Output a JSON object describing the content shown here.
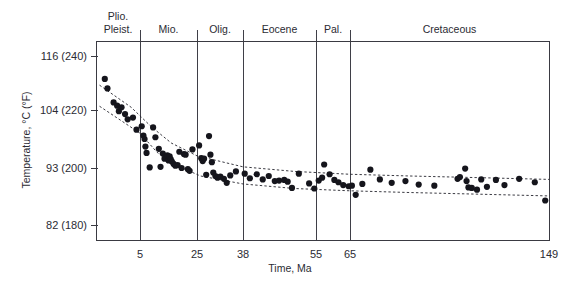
{
  "chart_data": {
    "type": "scatter",
    "title": "",
    "xlabel": "Time, Ma",
    "ylabel": "Temperature, °C (°F)",
    "xlim": [
      0,
      149
    ],
    "ylim": [
      180,
      240
    ],
    "x_unit": "Ma",
    "y_unit_primary": "°C",
    "y_unit_secondary": "°F",
    "grid": false,
    "legend": "none",
    "x_ticks": [
      {
        "value": 5,
        "label": "5"
      },
      {
        "value": 25,
        "label": "25"
      },
      {
        "value": 38,
        "label": "38"
      },
      {
        "value": 55,
        "label": "55"
      },
      {
        "value": 65,
        "label": "65"
      },
      {
        "value": 149,
        "label": "149"
      }
    ],
    "y_ticks": [
      {
        "value": 240,
        "label": "116 (240)",
        "celsius": 116,
        "fahrenheit": 240
      },
      {
        "value": 220,
        "label": "104 (220)",
        "celsius": 104,
        "fahrenheit": 220
      },
      {
        "value": 200,
        "label": "93 (200)",
        "celsius": 93,
        "fahrenheit": 200
      },
      {
        "value": 180,
        "label": "82 (180)",
        "celsius": 82,
        "fahrenheit": 180
      }
    ],
    "epochs": [
      {
        "name": "Plio.\nPleist.",
        "line1": "Plio.",
        "line2": "Pleist.",
        "start": 0,
        "end": 5
      },
      {
        "name": "Mio.",
        "line1": "Mio.",
        "line2": "",
        "start": 5,
        "end": 25
      },
      {
        "name": "Olig.",
        "line1": "Olig.",
        "line2": "",
        "start": 25,
        "end": 38
      },
      {
        "name": "Eocene",
        "line1": "Eocene",
        "line2": "",
        "start": 38,
        "end": 55
      },
      {
        "name": "Pal.",
        "line1": "Pal.",
        "line2": "",
        "start": 55,
        "end": 65
      },
      {
        "name": "Cretaceous",
        "line1": "Cretaceous",
        "line2": "",
        "start": 65,
        "end": 149
      }
    ],
    "epoch_boundaries": [
      5,
      25,
      38,
      55,
      65
    ],
    "series": [
      {
        "name": "Measured bottom-hole temperature",
        "marker": "filled-circle",
        "color": "#15151c",
        "points": [
          [
            1.0,
            231.5
          ],
          [
            1.3,
            228.0
          ],
          [
            2.0,
            222.8
          ],
          [
            2.4,
            221.6
          ],
          [
            2.6,
            219.6
          ],
          [
            2.9,
            221.0
          ],
          [
            3.3,
            218.6
          ],
          [
            3.6,
            216.8
          ],
          [
            4.2,
            217.4
          ],
          [
            4.6,
            213.2
          ],
          [
            5.6,
            214.4
          ],
          [
            6.2,
            211.2
          ],
          [
            6.6,
            210.0
          ],
          [
            6.9,
            207.4
          ],
          [
            7.3,
            205.2
          ],
          [
            8.4,
            200.2
          ],
          [
            9.6,
            214.0
          ],
          [
            10.4,
            210.6
          ],
          [
            11.6,
            206.6
          ],
          [
            12.2,
            200.4
          ],
          [
            13.0,
            205.0
          ],
          [
            13.6,
            203.2
          ],
          [
            14.1,
            203.8
          ],
          [
            14.6,
            204.4
          ],
          [
            15.0,
            202.6
          ],
          [
            15.4,
            204.0
          ],
          [
            15.8,
            203.0
          ],
          [
            16.2,
            202.2
          ],
          [
            16.8,
            201.4
          ],
          [
            17.4,
            200.8
          ],
          [
            18.2,
            201.0
          ],
          [
            18.8,
            205.6
          ],
          [
            19.6,
            200.0
          ],
          [
            20.4,
            204.8
          ],
          [
            21.0,
            204.6
          ],
          [
            21.8,
            199.6
          ],
          [
            22.4,
            199.0
          ],
          [
            23.4,
            206.4
          ],
          [
            25.6,
            207.8
          ],
          [
            26.2,
            203.4
          ],
          [
            26.6,
            202.4
          ],
          [
            27.0,
            203.2
          ],
          [
            27.6,
            197.6
          ],
          [
            28.4,
            211.0
          ],
          [
            28.8,
            204.6
          ],
          [
            29.2,
            202.0
          ],
          [
            29.6,
            198.4
          ],
          [
            30.2,
            197.2
          ],
          [
            30.8,
            196.6
          ],
          [
            31.6,
            197.0
          ],
          [
            32.6,
            196.2
          ],
          [
            33.4,
            194.8
          ],
          [
            34.4,
            197.4
          ],
          [
            36.0,
            198.8
          ],
          [
            38.4,
            198.0
          ],
          [
            39.6,
            196.4
          ],
          [
            41.2,
            197.8
          ],
          [
            42.6,
            196.0
          ],
          [
            44.0,
            197.2
          ],
          [
            45.4,
            195.4
          ],
          [
            46.4,
            195.6
          ],
          [
            47.6,
            195.8
          ],
          [
            48.4,
            195.2
          ],
          [
            49.4,
            193.0
          ],
          [
            51.0,
            198.0
          ],
          [
            53.4,
            194.6
          ],
          [
            54.6,
            192.8
          ],
          [
            55.8,
            195.6
          ],
          [
            56.8,
            196.6
          ],
          [
            57.4,
            201.2
          ],
          [
            59.0,
            197.8
          ],
          [
            60.4,
            195.8
          ],
          [
            61.6,
            195.0
          ],
          [
            63.0,
            194.0
          ],
          [
            64.6,
            193.6
          ],
          [
            65.8,
            193.8
          ],
          [
            67.4,
            190.6
          ],
          [
            70.2,
            194.4
          ],
          [
            73.6,
            199.4
          ],
          [
            77.6,
            196.0
          ],
          [
            82.6,
            194.8
          ],
          [
            88.4,
            195.4
          ],
          [
            94.0,
            194.2
          ],
          [
            100.6,
            193.8
          ],
          [
            110.4,
            196.2
          ],
          [
            111.4,
            196.8
          ],
          [
            113.6,
            199.8
          ],
          [
            114.2,
            195.4
          ],
          [
            115.0,
            193.2
          ],
          [
            116.4,
            193.0
          ],
          [
            118.6,
            192.4
          ],
          [
            120.4,
            196.0
          ],
          [
            122.8,
            193.4
          ],
          [
            126.6,
            195.8
          ],
          [
            130.2,
            194.0
          ],
          [
            136.4,
            196.2
          ],
          [
            143.0,
            195.0
          ],
          [
            147.4,
            188.6
          ]
        ]
      }
    ],
    "envelopes": [
      {
        "name": "upper-bound-trend",
        "style": "dashed",
        "points": [
          [
            0.4,
            229.2
          ],
          [
            4.0,
            221.0
          ],
          [
            9.0,
            214.2
          ],
          [
            16.0,
            208.6
          ],
          [
            25.0,
            204.2
          ],
          [
            38.0,
            200.4
          ],
          [
            50.0,
            198.8
          ],
          [
            65.0,
            197.8
          ],
          [
            90.0,
            197.2
          ],
          [
            120.0,
            196.6
          ],
          [
            149.0,
            196.0
          ]
        ]
      },
      {
        "name": "lower-bound-trend",
        "style": "dashed",
        "points": [
          [
            0.4,
            221.4
          ],
          [
            5.0,
            212.0
          ],
          [
            11.0,
            205.4
          ],
          [
            18.0,
            200.8
          ],
          [
            26.0,
            197.2
          ],
          [
            38.0,
            194.4
          ],
          [
            50.0,
            192.8
          ],
          [
            65.0,
            192.0
          ],
          [
            90.0,
            191.4
          ],
          [
            120.0,
            190.8
          ],
          [
            149.0,
            190.2
          ]
        ]
      }
    ]
  },
  "axes": {
    "y_title": "Temperature, °C (°F)",
    "x_title": "Time, Ma"
  },
  "colors": {
    "point": "#15151c",
    "frame": "#3a3a42",
    "divider": "#3f3f47",
    "envelope": "#24242c",
    "text": "#2b2b33",
    "background": "#ffffff"
  }
}
